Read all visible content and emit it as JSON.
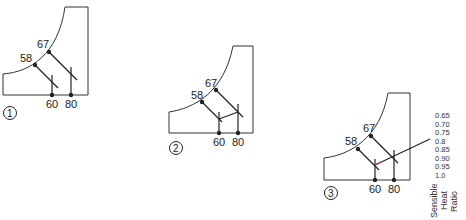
{
  "diagrams": [
    {
      "number": "1",
      "wet_bulb_low": "58",
      "wet_bulb_high": "67",
      "dry_bulb_low": "60",
      "dry_bulb_high": "80"
    },
    {
      "number": "2",
      "wet_bulb_low": "58",
      "wet_bulb_high": "67",
      "dry_bulb_low": "60",
      "dry_bulb_high": "80"
    },
    {
      "number": "3",
      "wet_bulb_low": "58",
      "wet_bulb_high": "67",
      "dry_bulb_low": "60",
      "dry_bulb_high": "80"
    }
  ],
  "shr_scale": {
    "values": [
      "0.65",
      "0.70",
      "0.75",
      "0.8",
      "0.85",
      "0.90",
      "0.95",
      "1.0"
    ],
    "label_line1": "Sensible",
    "label_line2": "Heat",
    "label_line3": "Ratio"
  },
  "colors": {
    "line": "#222222",
    "frame": "#333333",
    "accent_red": "#c0392b"
  }
}
